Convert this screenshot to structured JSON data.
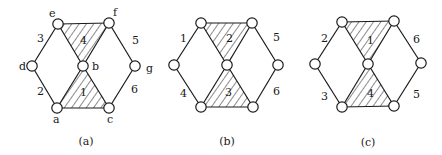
{
  "figure": {
    "background": "#ffffff",
    "ink": "#1a1a1a",
    "panels": [
      {
        "caption": "(a)",
        "caption_pos": [
          86,
          145
        ],
        "nodes": [
          {
            "id": "e",
            "x": 58,
            "y": 24,
            "label": "e",
            "lx": 49,
            "ly": 17
          },
          {
            "id": "f",
            "x": 109,
            "y": 23,
            "label": "f",
            "lx": 113,
            "ly": 16
          },
          {
            "id": "d",
            "x": 32,
            "y": 66,
            "label": "d",
            "lx": 19,
            "ly": 70
          },
          {
            "id": "b",
            "x": 83,
            "y": 66,
            "label": "b",
            "lx": 92,
            "ly": 70
          },
          {
            "id": "g",
            "x": 135,
            "y": 66,
            "label": "g",
            "lx": 146,
            "ly": 72
          },
          {
            "id": "a",
            "x": 57,
            "y": 108,
            "label": "a",
            "lx": 53,
            "ly": 123
          },
          {
            "id": "c",
            "x": 109,
            "y": 108,
            "label": "c",
            "lx": 107,
            "ly": 123
          }
        ],
        "edges": [
          [
            "e",
            "f"
          ],
          [
            "e",
            "d"
          ],
          [
            "d",
            "a"
          ],
          [
            "a",
            "c"
          ],
          [
            "e",
            "b"
          ],
          [
            "b",
            "c"
          ],
          [
            "f",
            "b"
          ],
          [
            "b",
            "a"
          ],
          [
            "f",
            "g"
          ],
          [
            "g",
            "c"
          ]
        ],
        "face_labels": [
          {
            "text": "3",
            "x": 37,
            "y": 42
          },
          {
            "text": "2",
            "x": 37,
            "y": 95
          },
          {
            "text": "4",
            "x": 80,
            "y": 44
          },
          {
            "text": "1",
            "x": 80,
            "y": 96
          },
          {
            "text": "5",
            "x": 132,
            "y": 44
          },
          {
            "text": "6",
            "x": 131,
            "y": 93
          }
        ],
        "shaded": [
          [
            "e",
            "f",
            "b"
          ],
          [
            "b",
            "a",
            "c"
          ]
        ]
      },
      {
        "caption": "(b)",
        "caption_pos": [
          227,
          145
        ],
        "nodes": [
          {
            "id": "tl",
            "x": 201,
            "y": 23,
            "label": ""
          },
          {
            "id": "tr",
            "x": 252,
            "y": 23,
            "label": ""
          },
          {
            "id": "l",
            "x": 174,
            "y": 65,
            "label": ""
          },
          {
            "id": "m",
            "x": 227,
            "y": 65,
            "label": ""
          },
          {
            "id": "r",
            "x": 278,
            "y": 65,
            "label": ""
          },
          {
            "id": "bl",
            "x": 201,
            "y": 107,
            "label": ""
          },
          {
            "id": "br",
            "x": 253,
            "y": 107,
            "label": ""
          }
        ],
        "edges": [
          [
            "tl",
            "tr"
          ],
          [
            "tl",
            "l"
          ],
          [
            "l",
            "bl"
          ],
          [
            "bl",
            "br"
          ],
          [
            "tl",
            "m"
          ],
          [
            "m",
            "br"
          ],
          [
            "tr",
            "m"
          ],
          [
            "m",
            "bl"
          ],
          [
            "tr",
            "r"
          ],
          [
            "r",
            "br"
          ]
        ],
        "face_labels": [
          {
            "text": "1",
            "x": 180,
            "y": 42
          },
          {
            "text": "4",
            "x": 180,
            "y": 97
          },
          {
            "text": "2",
            "x": 226,
            "y": 42
          },
          {
            "text": "3",
            "x": 225,
            "y": 96
          },
          {
            "text": "5",
            "x": 273,
            "y": 41
          },
          {
            "text": "6",
            "x": 273,
            "y": 95
          }
        ],
        "shaded": [
          [
            "tl",
            "tr",
            "m"
          ],
          [
            "m",
            "bl",
            "br"
          ]
        ]
      },
      {
        "caption": "(c)",
        "caption_pos": [
          368,
          146
        ],
        "nodes": [
          {
            "id": "tl",
            "x": 342,
            "y": 22,
            "label": ""
          },
          {
            "id": "tr",
            "x": 394,
            "y": 21,
            "label": ""
          },
          {
            "id": "l",
            "x": 315,
            "y": 64,
            "label": ""
          },
          {
            "id": "m",
            "x": 368,
            "y": 64,
            "label": ""
          },
          {
            "id": "r",
            "x": 421,
            "y": 63,
            "label": ""
          },
          {
            "id": "bl",
            "x": 342,
            "y": 107,
            "label": ""
          },
          {
            "id": "br",
            "x": 394,
            "y": 106,
            "label": ""
          }
        ],
        "edges": [
          [
            "tl",
            "tr"
          ],
          [
            "tl",
            "l"
          ],
          [
            "l",
            "bl"
          ],
          [
            "bl",
            "br"
          ],
          [
            "tl",
            "m"
          ],
          [
            "m",
            "br"
          ],
          [
            "tr",
            "m"
          ],
          [
            "m",
            "bl"
          ],
          [
            "tr",
            "r"
          ],
          [
            "r",
            "br"
          ]
        ],
        "face_labels": [
          {
            "text": "2",
            "x": 321,
            "y": 42
          },
          {
            "text": "3",
            "x": 321,
            "y": 100
          },
          {
            "text": "1",
            "x": 367,
            "y": 44
          },
          {
            "text": "4",
            "x": 367,
            "y": 97
          },
          {
            "text": "6",
            "x": 413,
            "y": 43
          },
          {
            "text": "5",
            "x": 413,
            "y": 98
          }
        ],
        "shaded": [
          [
            "tl",
            "tr",
            "m"
          ],
          [
            "m",
            "bl",
            "br"
          ]
        ]
      }
    ]
  }
}
